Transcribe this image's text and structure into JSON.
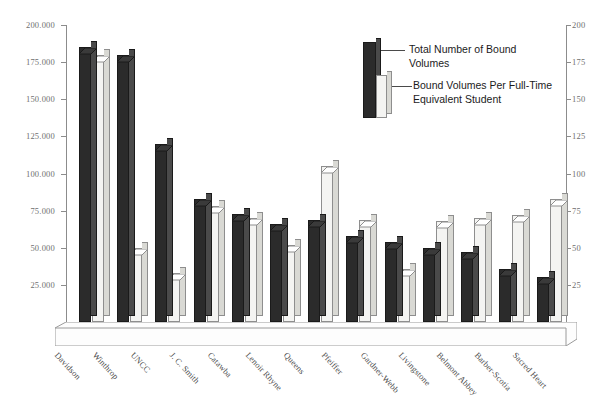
{
  "chart_data": {
    "type": "bar",
    "title": "",
    "subtitle": "",
    "xlabel": "",
    "ylabel": "",
    "categories": [
      "Davidson",
      "Winthrop",
      "UNCC",
      "J. C. Smith",
      "Catawba",
      "Lenoir Rhyne",
      "Queens",
      "Pfeiffer",
      "Gardner-Webb",
      "Livingstone",
      "Belmont Abbey",
      "Barber-Scotia",
      "Sacred Heart"
    ],
    "series": [
      {
        "name": "Total Number of Bound Volumes",
        "axis": "left",
        "color": "#2b2b2b",
        "values": [
          185000,
          180000,
          120000,
          83000,
          73000,
          66000,
          69000,
          58000,
          54000,
          50000,
          47000,
          36000,
          30000
        ]
      },
      {
        "name": "Bound Volumes Per Full-Time Equivalent Student",
        "axis": "right",
        "color": "#f4f4f2",
        "values": [
          180,
          50,
          33,
          78,
          70,
          52,
          105,
          69,
          36,
          68,
          70,
          72,
          83
        ]
      }
    ],
    "left_axis": {
      "label": "",
      "ticks": [
        "25.000",
        "50.000",
        "75.000",
        "100.000",
        "125.000",
        "150.000",
        "175.000",
        "200.000"
      ],
      "tick_values": [
        25000,
        50000,
        75000,
        100000,
        125000,
        150000,
        175000,
        200000
      ],
      "min": 0,
      "max": 200000
    },
    "right_axis": {
      "label": "",
      "ticks": [
        "25",
        "50",
        "75",
        "100",
        "125",
        "150",
        "175",
        "200"
      ],
      "tick_values": [
        25,
        50,
        75,
        100,
        125,
        150,
        175,
        200
      ],
      "min": 0,
      "max": 200
    },
    "grid": false,
    "legend_position": "upper-right",
    "legend": [
      "Total Number of Bound\nVolumes",
      "Bound Volumes Per Full-Time\nEquivalent Student"
    ]
  }
}
